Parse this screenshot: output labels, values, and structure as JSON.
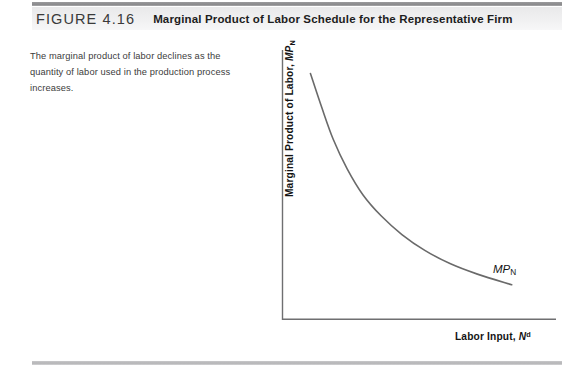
{
  "figure": {
    "number_label": "FIGURE 4.16",
    "title": "Marginal Product of Labor Schedule for the Representative Firm",
    "caption": "The marginal product of labor declines as the quantity of labor used in the production process increases.",
    "rule_color": "#8e8e90",
    "header_band_color": "#ededee"
  },
  "chart_data": {
    "type": "line",
    "title": "Marginal Product of Labor Schedule for the Representative Firm",
    "xlabel_parts": {
      "text": "Labor Input, ",
      "symbol": "N",
      "superscript": "d"
    },
    "ylabel_parts": {
      "text": "Marginal Product of Labor, ",
      "symbol": "MP",
      "subscript": "N"
    },
    "xlabel": "Labor Input, N^d",
    "ylabel": "Marginal Product of Labor, MP_N",
    "series": [
      {
        "name": "MP_N",
        "label_parts": {
          "symbol": "MP",
          "subscript": "N"
        },
        "color": "#6a6a6a",
        "x": [
          0.12,
          0.17,
          0.22,
          0.28,
          0.35,
          0.43,
          0.52,
          0.62,
          0.73,
          0.85,
          1.0
        ],
        "y": [
          0.93,
          0.8,
          0.68,
          0.57,
          0.47,
          0.39,
          0.32,
          0.26,
          0.21,
          0.17,
          0.13
        ]
      }
    ],
    "xlim": [
      0,
      1.15
    ],
    "ylim": [
      0,
      1.0
    ],
    "grid": false,
    "ticks": false,
    "legend": "none",
    "axis_color": "#6f6f71",
    "annotations": [
      {
        "text": "MP_N",
        "x": 0.82,
        "y": 0.3
      }
    ]
  }
}
